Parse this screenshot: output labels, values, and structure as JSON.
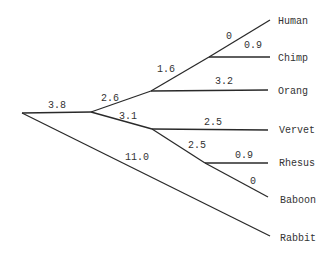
{
  "diagram": {
    "type": "phylogenetic-tree",
    "taxa": [
      "Human",
      "Chimp",
      "Orang",
      "Vervet",
      "Rhesus",
      "Baboon",
      "Rabbit"
    ],
    "branches": [
      {
        "id": "root-A",
        "length": "3.8"
      },
      {
        "id": "A-B",
        "length": "2.6"
      },
      {
        "id": "B-C",
        "length": "1.6"
      },
      {
        "id": "C-human",
        "length": "0",
        "taxon": "Human"
      },
      {
        "id": "C-chimp",
        "length": "0.9",
        "taxon": "Chimp"
      },
      {
        "id": "B-orang",
        "length": "3.2",
        "taxon": "Orang"
      },
      {
        "id": "A-D",
        "length": "3.1"
      },
      {
        "id": "D-vervet",
        "length": "2.5",
        "taxon": "Vervet"
      },
      {
        "id": "D-E",
        "length": "2.5"
      },
      {
        "id": "E-rhesus",
        "length": "0.9",
        "taxon": "Rhesus"
      },
      {
        "id": "E-baboon",
        "length": "0",
        "taxon": "Baboon"
      },
      {
        "id": "root-rabbit",
        "length": "11.0",
        "taxon": "Rabbit"
      }
    ]
  },
  "labels": {
    "human": "Human",
    "chimp": "Chimp",
    "orang": "Orang",
    "vervet": "Vervet",
    "rhesus": "Rhesus",
    "baboon": "Baboon",
    "rabbit": "Rabbit"
  },
  "lengths": {
    "root_a": "3.8",
    "a_b": "2.6",
    "b_c": "1.6",
    "c_human": "0",
    "c_chimp": "0.9",
    "b_orang": "3.2",
    "a_d": "3.1",
    "d_vervet": "2.5",
    "d_e": "2.5",
    "e_rhesus": "0.9",
    "e_baboon": "0",
    "root_rabbit": "11.0"
  }
}
